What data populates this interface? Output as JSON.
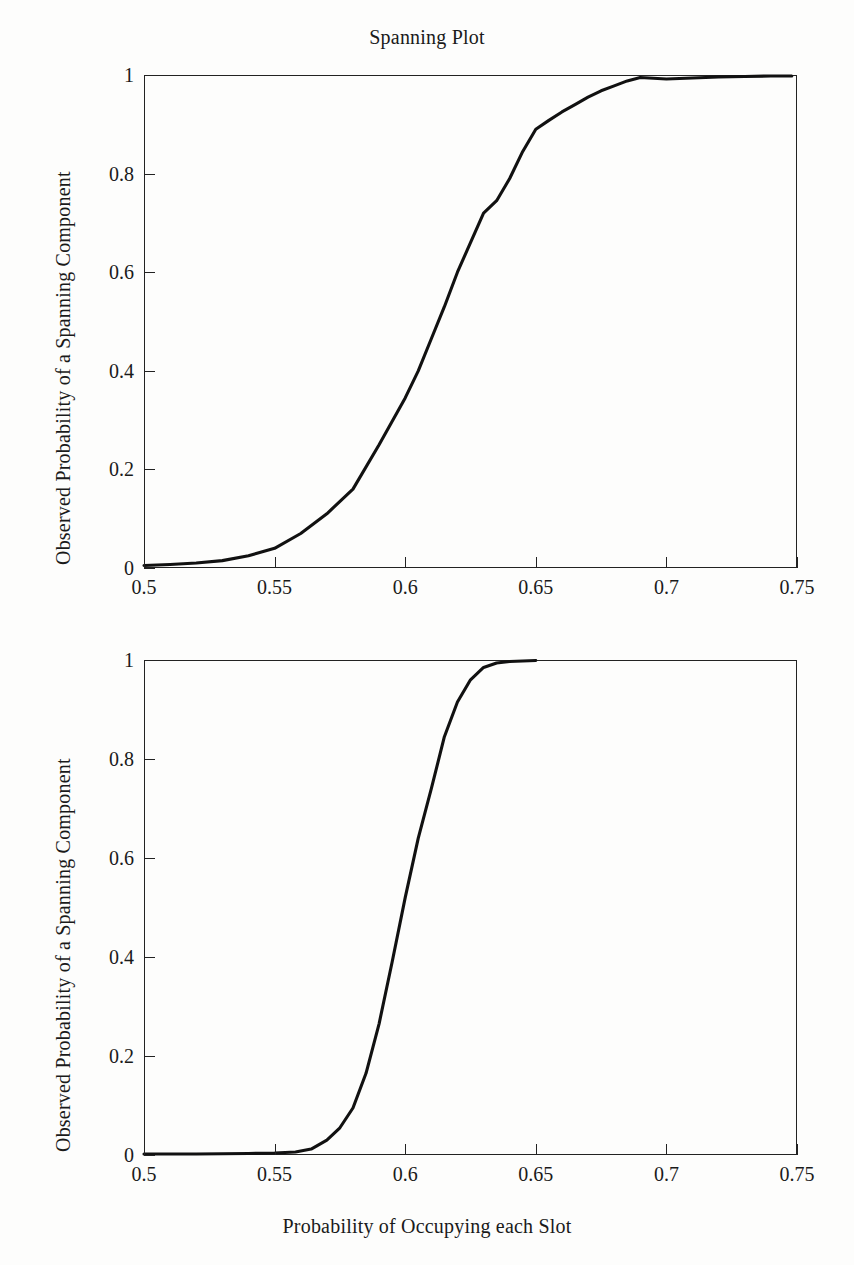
{
  "figure": {
    "title": "Spanning Plot",
    "background": "#fdfdfc",
    "ink_color": "#111111"
  },
  "axes_common": {
    "ylabel": "Observed Probability of a Spanning Component",
    "xlabel": "Probability of Occupying each Slot",
    "xticks": [
      "0.5",
      "0.55",
      "0.6",
      "0.65",
      "0.7",
      "0.75"
    ],
    "yticks": [
      "0",
      "0.2",
      "0.4",
      "0.6",
      "0.8",
      "1"
    ]
  },
  "chart_data": [
    {
      "type": "line",
      "title": "Spanning Plot",
      "xlabel": "",
      "ylabel": "Observed Probability of a Spanning Component",
      "xlim": [
        0.5,
        0.75
      ],
      "ylim": [
        0,
        1
      ],
      "xticks": [
        0.5,
        0.55,
        0.6,
        0.65,
        0.7,
        0.75
      ],
      "yticks": [
        0,
        0.2,
        0.4,
        0.6,
        0.8,
        1
      ],
      "grid": false,
      "legend": "none",
      "series": [
        {
          "name": "Observed spanning probability (shallow sigmoid)",
          "x": [
            0.5,
            0.51,
            0.52,
            0.53,
            0.54,
            0.55,
            0.56,
            0.57,
            0.58,
            0.59,
            0.6,
            0.605,
            0.61,
            0.615,
            0.62,
            0.625,
            0.63,
            0.635,
            0.64,
            0.645,
            0.65,
            0.655,
            0.66,
            0.665,
            0.67,
            0.675,
            0.68,
            0.685,
            0.69,
            0.7,
            0.71,
            0.72,
            0.73,
            0.74,
            0.748
          ],
          "y": [
            0.005,
            0.007,
            0.01,
            0.015,
            0.025,
            0.04,
            0.07,
            0.11,
            0.16,
            0.25,
            0.345,
            0.4,
            0.465,
            0.53,
            0.6,
            0.66,
            0.72,
            0.745,
            0.79,
            0.845,
            0.89,
            0.908,
            0.925,
            0.94,
            0.955,
            0.968,
            0.978,
            0.988,
            0.995,
            0.992,
            0.994,
            0.996,
            0.997,
            0.998,
            0.998
          ]
        }
      ]
    },
    {
      "type": "line",
      "title": "",
      "xlabel": "Probability of Occupying each Slot",
      "ylabel": "Observed Probability of a Spanning Component",
      "xlim": [
        0.5,
        0.75
      ],
      "ylim": [
        0,
        1
      ],
      "xticks": [
        0.5,
        0.55,
        0.6,
        0.65,
        0.7,
        0.75
      ],
      "yticks": [
        0,
        0.2,
        0.4,
        0.6,
        0.8,
        1
      ],
      "grid": false,
      "legend": "none",
      "series": [
        {
          "name": "Observed spanning probability (sharp sigmoid)",
          "x": [
            0.5,
            0.52,
            0.54,
            0.55,
            0.558,
            0.564,
            0.57,
            0.575,
            0.58,
            0.585,
            0.59,
            0.595,
            0.6,
            0.605,
            0.61,
            0.615,
            0.62,
            0.625,
            0.63,
            0.635,
            0.64,
            0.645,
            0.65
          ],
          "y": [
            0.002,
            0.002,
            0.003,
            0.004,
            0.006,
            0.012,
            0.03,
            0.055,
            0.095,
            0.165,
            0.265,
            0.39,
            0.52,
            0.64,
            0.74,
            0.845,
            0.915,
            0.96,
            0.985,
            0.994,
            0.997,
            0.998,
            0.999
          ]
        }
      ]
    }
  ]
}
